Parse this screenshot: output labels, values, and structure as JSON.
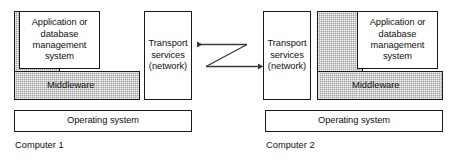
{
  "diagram": {
    "background_color": "#ffffff",
    "line_color": "#1a1a1a",
    "middleware_fill": "#b4b4b4"
  },
  "computers": [
    {
      "caption": "Computer 1",
      "side": "left",
      "application_box": "Application or database management system",
      "application_lines": [
        "Application or",
        "database",
        "management",
        "system"
      ],
      "middleware_label": "Middleware",
      "transport_box": "Transport services (network)",
      "transport_lines": [
        "Transport",
        "services",
        "(network)"
      ],
      "operating_system": "Operating system"
    },
    {
      "caption": "Computer 2",
      "side": "right",
      "application_box": "Application or database management system",
      "application_lines": [
        "Application or",
        "database",
        "management",
        "system"
      ],
      "middleware_label": "Middleware",
      "transport_box": "Transport services (network)",
      "transport_lines": [
        "Transport",
        "services",
        "(network)"
      ],
      "operating_system": "Operating system"
    }
  ],
  "network_link": {
    "shape": "z-crossover",
    "inbound_arrow_target": "Computer 1 transport services (network)",
    "outbound_arrow_target": "Computer 2 transport services (network)",
    "arrowheads": 2
  }
}
